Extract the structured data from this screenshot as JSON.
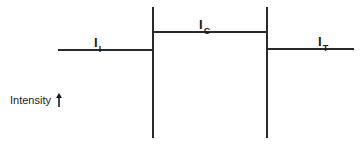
{
  "diagram": {
    "regions": [
      {
        "id": "incident",
        "label_main": "I",
        "label_sub": "I",
        "level": "medium"
      },
      {
        "id": "center",
        "label_main": "I",
        "label_sub": "C",
        "level": "high"
      },
      {
        "id": "transmitted",
        "label_main": "I",
        "label_sub": "T",
        "level": "medium"
      }
    ],
    "axis": {
      "label": "Intensity",
      "arrow_icon": "arrow-up-icon"
    },
    "colors": {
      "line": "#2a2a2a",
      "background": "#ffffff"
    }
  }
}
